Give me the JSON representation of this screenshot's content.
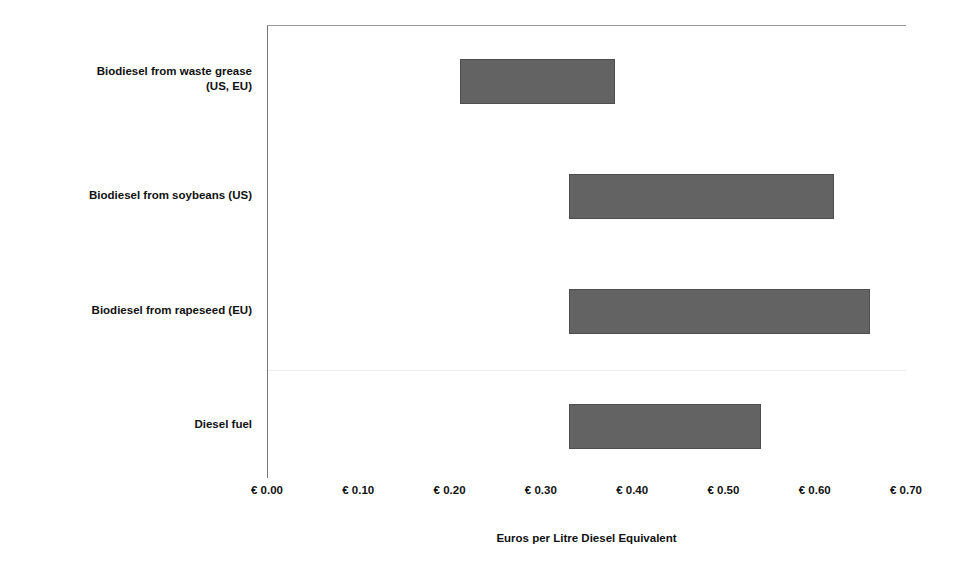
{
  "chart_data": {
    "type": "bar",
    "subtype": "floating-range-bar",
    "title": "",
    "xlabel": "Euros per Litre Diesel Equivalent",
    "ylabel": "",
    "xlim": [
      0.0,
      0.7
    ],
    "xtick_values": [
      0.0,
      0.1,
      0.2,
      0.3,
      0.4,
      0.5,
      0.6,
      0.7
    ],
    "xtick_labels": [
      "€ 0.00",
      "€ 0.10",
      "€ 0.20",
      "€ 0.30",
      "€ 0.40",
      "€ 0.50",
      "€ 0.60",
      "€ 0.70"
    ],
    "grid": false,
    "legend": false,
    "bar_color": "#636363",
    "bar_border_color": "#4e4e4e",
    "categories": [
      "Biodiesel from waste grease\n(US, EU)",
      "Biodiesel from soybeans (US)",
      "Biodiesel from rapeseed (EU)",
      "Diesel fuel"
    ],
    "series": [
      {
        "name": "low",
        "values": [
          0.21,
          0.33,
          0.33,
          0.33
        ]
      },
      {
        "name": "high",
        "values": [
          0.38,
          0.62,
          0.66,
          0.54
        ]
      }
    ],
    "bars": [
      {
        "category": "Biodiesel from waste grease\n(US, EU)",
        "low": 0.21,
        "high": 0.38
      },
      {
        "category": "Biodiesel from soybeans (US)",
        "low": 0.33,
        "high": 0.62
      },
      {
        "category": "Biodiesel from rapeseed (EU)",
        "low": 0.33,
        "high": 0.66
      },
      {
        "category": "Diesel fuel",
        "low": 0.33,
        "high": 0.54
      }
    ]
  }
}
